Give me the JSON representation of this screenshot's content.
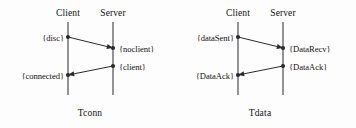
{
  "figure": {
    "background": "#fdfdfd",
    "line_color": "#2b2b2b",
    "text_color": "#131313"
  },
  "diagrams": [
    {
      "id": "tconn",
      "caption": "Tconn",
      "caption_x": 90,
      "caption_y": 108,
      "actors": [
        {
          "name": "Client",
          "label": "Client",
          "x": 68,
          "label_y": 8,
          "lifeline_top": 22,
          "lifeline_bottom": 95
        },
        {
          "name": "Server",
          "label": "Server",
          "x": 113,
          "label_y": 8,
          "lifeline_top": 22,
          "lifeline_bottom": 95
        }
      ],
      "messages": [
        {
          "name": "disc-to-noclient",
          "from_x": 68,
          "from_y": 37,
          "to_x": 113,
          "to_y": 48,
          "direction": "client-to-server"
        },
        {
          "name": "client-to-connected",
          "from_x": 113,
          "from_y": 66,
          "to_x": 68,
          "to_y": 75,
          "direction": "server-to-client"
        }
      ],
      "states": [
        {
          "name": "state-disc",
          "label": "{disc}",
          "x": 64,
          "y": 33,
          "side": "left-of"
        },
        {
          "name": "state-noclient",
          "label": "{noclient}",
          "x": 119,
          "y": 44,
          "side": "right-of"
        },
        {
          "name": "state-client",
          "label": "{client}",
          "x": 119,
          "y": 62,
          "side": "right-of"
        },
        {
          "name": "state-connected",
          "label": "{connected}",
          "x": 64,
          "y": 71,
          "side": "left-of"
        }
      ],
      "endpoints": [
        {
          "name": "endpoint-disc",
          "x": 68,
          "y": 37
        },
        {
          "name": "endpoint-noclient",
          "x": 113,
          "y": 48
        },
        {
          "name": "endpoint-client",
          "x": 113,
          "y": 66
        },
        {
          "name": "endpoint-connected",
          "x": 68,
          "y": 75
        }
      ]
    },
    {
      "id": "tdata",
      "caption": "Tdata",
      "caption_x": 82,
      "caption_y": 108,
      "actors": [
        {
          "name": "Client",
          "label": "Client",
          "x": 60,
          "label_y": 8,
          "lifeline_top": 22,
          "lifeline_bottom": 95
        },
        {
          "name": "Server",
          "label": "Server",
          "x": 105,
          "label_y": 8,
          "lifeline_top": 22,
          "lifeline_bottom": 95
        }
      ],
      "messages": [
        {
          "name": "datasent-to-datarecv",
          "from_x": 60,
          "from_y": 37,
          "to_x": 105,
          "to_y": 48,
          "direction": "client-to-server"
        },
        {
          "name": "dataack-to-dataack",
          "from_x": 105,
          "from_y": 66,
          "to_x": 60,
          "to_y": 75,
          "direction": "server-to-client"
        }
      ],
      "states": [
        {
          "name": "state-datasent",
          "label": "{dataSent}",
          "x": 56,
          "y": 33,
          "side": "left-of"
        },
        {
          "name": "state-datarecv",
          "label": "{DataRecv}",
          "x": 111,
          "y": 44,
          "side": "right-of"
        },
        {
          "name": "state-dataack-server",
          "label": "{DataAck}",
          "x": 111,
          "y": 62,
          "side": "right-of"
        },
        {
          "name": "state-dataack-client",
          "label": "{DataAck}",
          "x": 56,
          "y": 71,
          "side": "left-of"
        }
      ],
      "endpoints": [
        {
          "name": "endpoint-datasent",
          "x": 60,
          "y": 37
        },
        {
          "name": "endpoint-datarecv",
          "x": 105,
          "y": 48
        },
        {
          "name": "endpoint-dataack-server",
          "x": 105,
          "y": 66
        },
        {
          "name": "endpoint-dataack-client",
          "x": 60,
          "y": 75
        }
      ]
    }
  ]
}
